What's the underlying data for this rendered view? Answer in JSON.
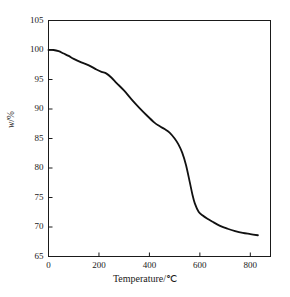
{
  "chart_data": {
    "type": "line",
    "title": "",
    "subtitle": "",
    "xlabel": "Temperature/℃",
    "ylabel": "w/%",
    "ylabel_italic_part": "w",
    "ylabel_rest": "/%",
    "xlim": [
      0,
      880
    ],
    "ylim": [
      65,
      105
    ],
    "xticks": [
      0,
      200,
      400,
      600,
      800
    ],
    "xtick_labels": [
      "0",
      "200",
      "400",
      "600",
      "800"
    ],
    "yticks": [
      65,
      70,
      75,
      80,
      85,
      90,
      95,
      100,
      105
    ],
    "ytick_labels": [
      "65",
      "70",
      "75",
      "80",
      "85",
      "90",
      "95",
      "100",
      "105"
    ],
    "grid": false,
    "legend": null,
    "legend_position": "none",
    "line_color": "#111111",
    "line_width": 1.8,
    "frame": "box",
    "tick_direction": "in",
    "annotations": [],
    "series": [
      {
        "name": "TGA mass loss",
        "x": [
          0,
          20,
          40,
          60,
          80,
          100,
          130,
          160,
          190,
          210,
          230,
          250,
          270,
          300,
          330,
          360,
          390,
          420,
          440,
          460,
          480,
          500,
          515,
          530,
          545,
          560,
          570,
          580,
          595,
          610,
          630,
          650,
          680,
          710,
          740,
          770,
          800,
          830
        ],
        "y": [
          100.0,
          100.0,
          99.8,
          99.4,
          99.0,
          98.5,
          97.9,
          97.4,
          96.7,
          96.3,
          96.0,
          95.3,
          94.4,
          93.1,
          91.6,
          90.2,
          88.9,
          87.7,
          87.1,
          86.6,
          86.0,
          85.0,
          84.0,
          82.6,
          80.5,
          77.6,
          75.6,
          74.0,
          72.6,
          72.0,
          71.4,
          70.9,
          70.2,
          69.7,
          69.3,
          69.0,
          68.8,
          68.6
        ]
      }
    ]
  },
  "axis_titles": {
    "x": "Temperature/℃",
    "y_italic": "w",
    "y_rest": "/%"
  }
}
